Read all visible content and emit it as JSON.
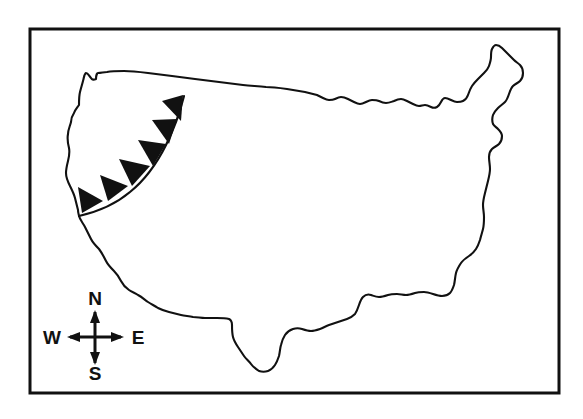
{
  "figure": {
    "background_color": "#ffffff",
    "ink_color": "#111111",
    "frame": {
      "name": "map-border-frame",
      "x": 30,
      "y": 29,
      "width": 529,
      "height": 364,
      "stroke_width": 3
    }
  },
  "map": {
    "region_label": "Contiguous United States",
    "outline_color": "#111111",
    "outline_width": 2.1,
    "fill_color": "#ffffff"
  },
  "weather_front": {
    "type": "cold-front",
    "symbol": "filled-triangles",
    "barb_count": 6,
    "color": "#111111",
    "line_width": 2.2,
    "description": "Cold front arc across the western United States",
    "start_point": {
      "x": 184,
      "y": 96
    },
    "end_point": {
      "x": 79,
      "y": 216
    },
    "barbs": [
      {
        "index": 1,
        "x": 177,
        "y": 103
      },
      {
        "index": 2,
        "x": 166,
        "y": 126
      },
      {
        "index": 3,
        "x": 152,
        "y": 151
      },
      {
        "index": 4,
        "x": 133,
        "y": 174
      },
      {
        "index": 5,
        "x": 111,
        "y": 192
      },
      {
        "index": 6,
        "x": 88,
        "y": 206
      }
    ]
  },
  "compass": {
    "name": "compass-rose",
    "center": {
      "x": 95,
      "y": 335
    },
    "arm_length": 28,
    "stroke_width": 3,
    "labels": {
      "north": "N",
      "south": "S",
      "east": "E",
      "west": "W"
    },
    "label_positions": {
      "north": {
        "x": 95,
        "y": 307
      },
      "south": {
        "x": 95,
        "y": 371
      },
      "east": {
        "x": 127,
        "y": 342
      },
      "west": {
        "x": 62,
        "y": 342
      }
    }
  }
}
